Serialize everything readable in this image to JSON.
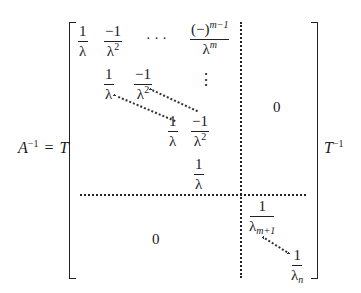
{
  "equation": {
    "lhs": "A",
    "lhs_sup": "−1",
    "equals": "=",
    "left_factor": "T",
    "right_factor": "T",
    "right_factor_sup": "−1"
  },
  "block_jordan": {
    "row1": [
      {
        "num": "1",
        "den": "λ"
      },
      {
        "num": "−1",
        "den": "λ",
        "den_sup": "2"
      },
      {
        "ellipsis": "· · ·"
      },
      {
        "num": "(−)",
        "num_sup": "m−1",
        "den": "λ",
        "den_sup": "m"
      }
    ],
    "row2": [
      {
        "num": "1",
        "den": "λ"
      },
      {
        "num": "−1",
        "den": "λ",
        "den_sup": "2"
      }
    ],
    "vdots": "⋮",
    "row3": [
      {
        "num": "1",
        "den": "λ"
      },
      {
        "num": "−1",
        "den": "λ",
        "den_sup": "2"
      }
    ],
    "row4": [
      {
        "num": "1",
        "den": "λ"
      }
    ]
  },
  "upper_right_zero": "0",
  "lower_left_zero": "0",
  "diagonal_block": {
    "first": {
      "num": "1",
      "den": "λ",
      "den_sub": "m+1"
    },
    "last": {
      "num": "1",
      "den": "λ",
      "den_sub": "n"
    }
  }
}
